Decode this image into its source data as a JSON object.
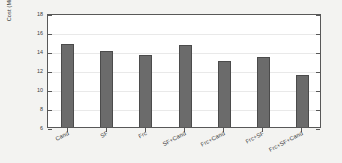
{
  "chart_data": {
    "type": "bar",
    "title": "",
    "xlabel": "",
    "ylabel": "Cost  (Millions ($))",
    "categories": [
      "Cand",
      "SF",
      "Frc",
      "SF+Cand",
      "Frc+Cand",
      "Frc+SF",
      "Frc+SF+Cand"
    ],
    "values": [
      14.7,
      14.05,
      13.55,
      14.6,
      12.9,
      13.35,
      11.5
    ],
    "ylim": [
      6,
      18
    ],
    "yticks": [
      18,
      16,
      14,
      12,
      10,
      8,
      6
    ],
    "ytick_labels": [
      "18",
      "16",
      "14",
      "12",
      "10",
      "8",
      "6"
    ],
    "grid": true,
    "legend": false,
    "bar_color": "#6b6b6b",
    "bar_edge_color": "#4b4b4b",
    "axis_color": "#585858",
    "grid_color": "#e9e9e9",
    "plot_background": "#ffffff",
    "figure_background": "#f3f3f1"
  }
}
